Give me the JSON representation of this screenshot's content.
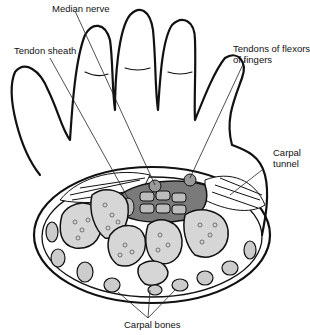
{
  "diagram": {
    "labels": {
      "median_nerve": "Median nerve",
      "tendon_sheath": "Tendon sheath",
      "tendons_flexors_line1": "Tendons of flexors",
      "tendons_flexors_line2": "of fingers",
      "carpal_tunnel_line1": "Carpal",
      "carpal_tunnel_line2": "tunnel",
      "carpal_bones": "Carpal bones"
    },
    "colors": {
      "outline": "#111111",
      "bone_fill": "#d6d6d6",
      "tunnel_fill": "#7a7a7a",
      "tendon_fill": "#bcbcbc",
      "background": "#ffffff"
    }
  }
}
